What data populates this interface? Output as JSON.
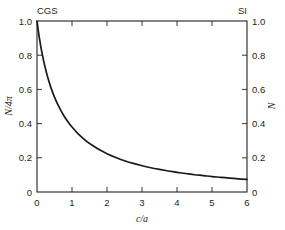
{
  "figure": {
    "background_color": "#ffffff",
    "ink_color": "#231f20",
    "curve_color": "#1a1a1a"
  },
  "corner_labels": {
    "top_left": "CGS",
    "top_right": "SI"
  },
  "chart_data": {
    "type": "line",
    "title": "",
    "subtitle": "",
    "xlabel": "c/a",
    "ylabel": "N/4π",
    "ylabel_right": "N",
    "xlim": [
      0,
      6
    ],
    "ylim": [
      0,
      1.0
    ],
    "grid": false,
    "legend": null,
    "legend_position": "none",
    "xticks": [
      0,
      1,
      2,
      3,
      4,
      5,
      6
    ],
    "xticklabels": [
      "0",
      "1",
      "2",
      "3",
      "4",
      "5",
      "6"
    ],
    "yticks": [
      0,
      0.2,
      0.4,
      0.6,
      0.8,
      1.0
    ],
    "yticklabels": [
      "0",
      "0.2",
      "0.4",
      "0.6",
      "0.8",
      "1.0"
    ],
    "yticks_right": [
      0,
      0.2,
      0.4,
      0.6,
      0.8,
      1.0
    ],
    "yticklabels_right": [
      "0",
      "0.2",
      "0.4",
      "0.6",
      "0.8",
      "1.0"
    ],
    "tick_direction": "in",
    "annotations": [
      "CGS",
      "SI"
    ],
    "series": [
      {
        "name": "demagnetizing factor",
        "x": [
          0.0,
          0.05,
          0.1,
          0.15,
          0.2,
          0.3,
          0.4,
          0.5,
          0.6,
          0.7,
          0.8,
          0.9,
          1.0,
          1.2,
          1.4,
          1.6,
          1.8,
          2.0,
          2.25,
          2.5,
          2.75,
          3.0,
          3.25,
          3.5,
          3.75,
          4.0,
          4.25,
          4.5,
          4.75,
          5.0,
          5.25,
          5.5,
          5.75,
          6.0
        ],
        "values": [
          1.0,
          0.925,
          0.861,
          0.806,
          0.757,
          0.675,
          0.609,
          0.555,
          0.509,
          0.47,
          0.436,
          0.406,
          0.38,
          0.335,
          0.299,
          0.27,
          0.245,
          0.224,
          0.202,
          0.183,
          0.167,
          0.154,
          0.142,
          0.132,
          0.123,
          0.115,
          0.108,
          0.101,
          0.096,
          0.09,
          0.086,
          0.081,
          0.077,
          0.074
        ]
      }
    ]
  }
}
